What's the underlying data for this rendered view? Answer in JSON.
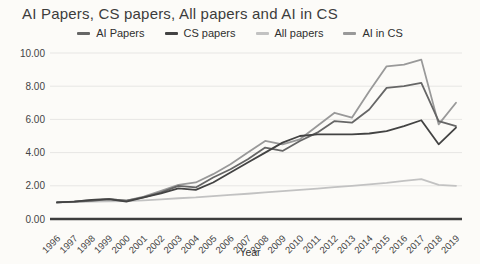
{
  "title": "AI Papers, CS papers, All papers and AI in CS",
  "x_axis_title": "Year",
  "chart_data": {
    "type": "line",
    "title": "AI Papers, CS papers, All papers and AI in CS",
    "xlabel": "Year",
    "ylabel": "",
    "ylim": [
      0,
      10
    ],
    "yticks": [
      0,
      2,
      4,
      6,
      8,
      10
    ],
    "ytick_labels": [
      "0.00",
      "2.00",
      "4.00",
      "6.00",
      "8.00",
      "10.00"
    ],
    "grid": true,
    "legend_position": "top",
    "x": [
      "1996",
      "1997",
      "1998",
      "1999",
      "2000",
      "2001",
      "2002",
      "2003",
      "2004",
      "2005",
      "2006",
      "2007",
      "2008",
      "2009",
      "2010",
      "2011",
      "2012",
      "2013",
      "2014",
      "2015",
      "2016",
      "2017",
      "2018",
      "2019"
    ],
    "series": [
      {
        "name": "AI Papers",
        "color": "#666666",
        "values": [
          1.0,
          1.05,
          1.1,
          1.2,
          1.1,
          1.3,
          1.6,
          2.0,
          1.9,
          2.5,
          3.0,
          3.6,
          4.3,
          4.1,
          4.7,
          5.2,
          5.9,
          5.8,
          6.6,
          7.9,
          8.0,
          8.2,
          5.9,
          5.6
        ]
      },
      {
        "name": "CS papers",
        "color": "#434343",
        "values": [
          1.0,
          1.05,
          1.15,
          1.2,
          1.05,
          1.3,
          1.55,
          1.85,
          1.75,
          2.2,
          2.8,
          3.4,
          4.0,
          4.6,
          5.0,
          5.1,
          5.1,
          5.1,
          5.15,
          5.3,
          5.6,
          5.95,
          4.5,
          5.5
        ]
      },
      {
        "name": "All papers",
        "color": "#c2c2c2",
        "values": [
          1.0,
          1.02,
          1.05,
          1.07,
          1.08,
          1.12,
          1.18,
          1.25,
          1.3,
          1.38,
          1.45,
          1.52,
          1.6,
          1.68,
          1.75,
          1.83,
          1.92,
          2.0,
          2.08,
          2.17,
          2.3,
          2.4,
          2.05,
          2.0
        ]
      },
      {
        "name": "AI in CS",
        "color": "#999999",
        "values": [
          1.0,
          1.05,
          1.15,
          1.2,
          1.1,
          1.35,
          1.7,
          2.05,
          2.2,
          2.7,
          3.3,
          4.0,
          4.7,
          4.5,
          4.8,
          5.6,
          6.4,
          6.1,
          7.7,
          9.2,
          9.3,
          9.6,
          5.7,
          7.0
        ]
      }
    ]
  },
  "layout": {
    "plot": {
      "x_left": 57,
      "x_right": 456,
      "y_bottom": 219,
      "y_top": 53,
      "grid_x_start": 50,
      "grid_x_end": 462
    },
    "colors": {
      "gridline": "#e7e6e4",
      "axis_line": "#3d3d3d",
      "tick_text": "#444444"
    }
  }
}
